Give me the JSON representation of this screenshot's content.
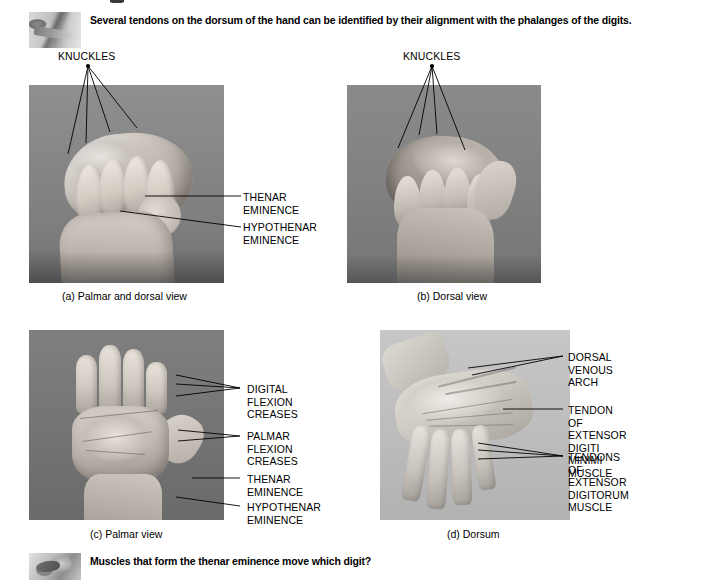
{
  "figure": {
    "intro": {
      "icon": "arm-thumbnail",
      "text": "Several tendons on the dorsum of the hand can be identified by their alignment with the phalanges of the digits."
    },
    "question": {
      "icon": "hand-thumbnail",
      "text": "Muscles that form the thenar eminence move which digit?"
    },
    "panels": [
      {
        "id": "a",
        "caption": "(a) Palmar and dorsal view",
        "labels": [
          {
            "name": "knuckles",
            "text": "KNUCKLES"
          },
          {
            "name": "thenar-eminence",
            "text": "THENAR\nEMINENCE"
          },
          {
            "name": "hypothenar-eminence",
            "text": "HYPOTHENAR\nEMINENCE"
          }
        ]
      },
      {
        "id": "b",
        "caption": "(b) Dorsal view",
        "labels": [
          {
            "name": "knuckles",
            "text": "KNUCKLES"
          }
        ]
      },
      {
        "id": "c",
        "caption": "(c) Palmar view",
        "labels": [
          {
            "name": "digital-flexion-creases",
            "text": "DIGITAL\nFLEXION\nCREASES"
          },
          {
            "name": "palmar-flexion-creases",
            "text": "PALMAR\nFLEXION\nCREASES"
          },
          {
            "name": "thenar-eminence",
            "text": "THENAR\nEMINENCE"
          },
          {
            "name": "hypothenar-eminence",
            "text": "HYPOTHENAR\nEMINENCE"
          }
        ]
      },
      {
        "id": "d",
        "caption": "(d) Dorsum",
        "labels": [
          {
            "name": "dorsal-venous-arch",
            "text": "DORSAL VENOUS\nARCH"
          },
          {
            "name": "tendon-extensor-digiti-minimi",
            "text": "TENDON OF\nEXTENSOR DIGITI\nMINIMI MUSCLE"
          },
          {
            "name": "tendons-extensor-digitorum",
            "text": "TENDONS OF\nEXTENSOR DIGITORUM\nMUSCLE"
          }
        ]
      }
    ]
  }
}
